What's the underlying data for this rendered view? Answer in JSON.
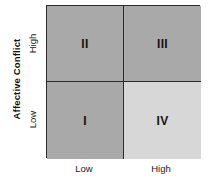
{
  "chart_data": {
    "type": "table",
    "title": "",
    "subtitle": "",
    "xlabel": "",
    "ylabel": "Affective Conflict",
    "x_tick_labels": [
      "Low",
      "High"
    ],
    "y_tick_labels": [
      "Low",
      "High"
    ],
    "grid": false,
    "legend": "none",
    "layout": "2x2 quadrant matrix",
    "quadrants": [
      {
        "id": "II",
        "label": "II",
        "x_level": "Low",
        "y_level": "High",
        "position": "top-left",
        "fill": "#a9a9a9",
        "shade": "shaded"
      },
      {
        "id": "III",
        "label": "III",
        "x_level": "High",
        "y_level": "High",
        "position": "top-right",
        "fill": "#a9a9a9",
        "shade": "shaded"
      },
      {
        "id": "I",
        "label": "I",
        "x_level": "Low",
        "y_level": "Low",
        "position": "bottom-left",
        "fill": "#a9a9a9",
        "shade": "shaded"
      },
      {
        "id": "IV",
        "label": "IV",
        "x_level": "High",
        "y_level": "Low",
        "position": "bottom-right",
        "fill": "#d7d7d7",
        "shade": "light"
      }
    ]
  },
  "axes": {
    "y_title": "Affective Conflict",
    "y_ticks": {
      "high": "High",
      "low": "Low"
    },
    "x_ticks": {
      "low": "Low",
      "high": "High"
    }
  },
  "colors": {
    "shaded_fill": "#a9a9a9",
    "light_fill": "#d7d7d7",
    "border": "#2b2b2b",
    "text": "#1a1a1a",
    "background": "#ffffff"
  }
}
